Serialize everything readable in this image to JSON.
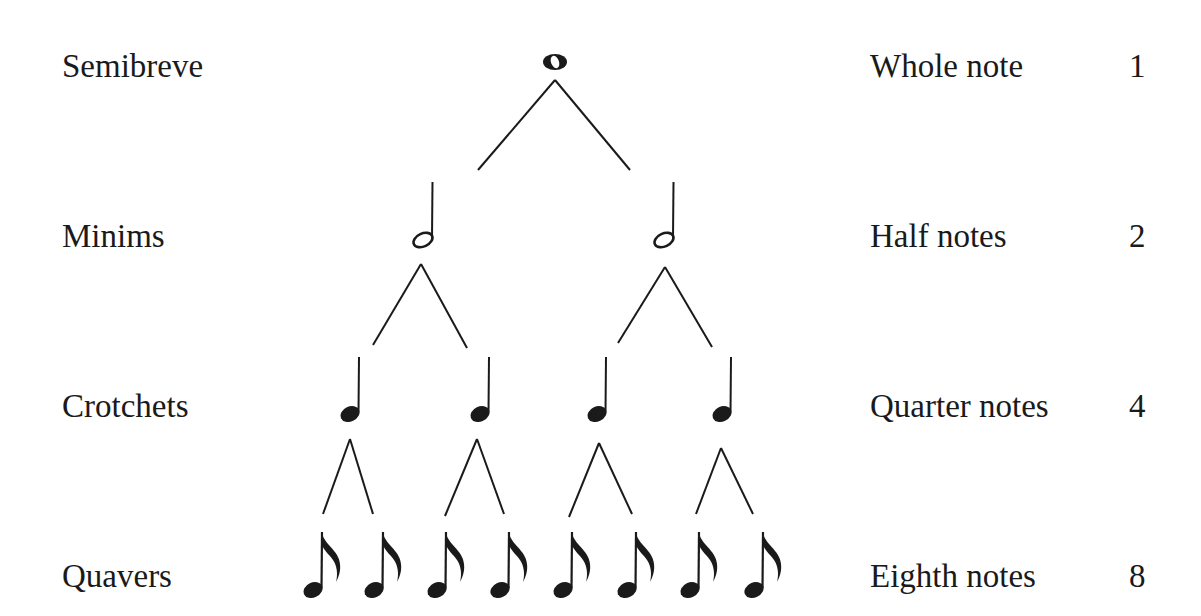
{
  "diagram": {
    "rows": [
      {
        "british_name": "Semibreve",
        "american_name": "Whole note",
        "count": "1",
        "note_type": "semibreve",
        "label_y": 50
      },
      {
        "british_name": "Minims",
        "american_name": "Half notes",
        "count": "2",
        "note_type": "minim",
        "label_y": 220
      },
      {
        "british_name": "Crotchets",
        "american_name": "Quarter notes",
        "count": "4",
        "note_type": "crotchet",
        "label_y": 390
      },
      {
        "british_name": "Quavers",
        "american_name": "Eighth notes",
        "count": "8",
        "note_type": "quaver",
        "label_y": 560
      }
    ],
    "colors": {
      "ink": "#1a1a1a",
      "background": "#ffffff"
    }
  }
}
